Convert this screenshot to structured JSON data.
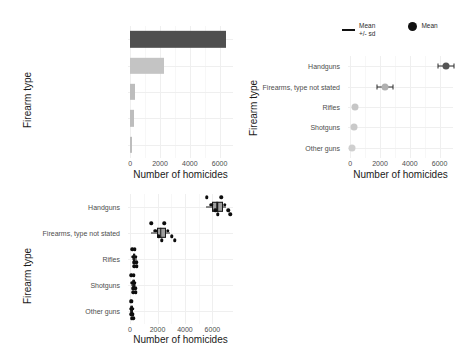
{
  "figure": {
    "categories": [
      "Other guns",
      "Shotguns",
      "Rifles",
      "Firearms, type not stated",
      "Handguns"
    ],
    "x_axis_title": "Number of homicides",
    "y_axis_title": "Firearm type",
    "x_ticks": [
      "0",
      "2000",
      "4000",
      "6000"
    ],
    "x_tick_values": [
      0,
      2000,
      4000,
      6000
    ],
    "x_range": [
      -150,
      6900
    ]
  },
  "chart_data": [
    {
      "id": "bar-panel",
      "type": "bar",
      "title": "",
      "xlabel": "Number of homicides",
      "ylabel": "Firearm type",
      "orientation": "horizontal",
      "categories": [
        "Other guns",
        "Shotguns",
        "Rifles",
        "Firearms, type not stated",
        "Handguns"
      ],
      "values": [
        100,
        250,
        300,
        2300,
        6400
      ],
      "bar_colors": [
        "#bdbdbd",
        "#bdbdbd",
        "#bdbdbd",
        "#c4c4c4",
        "#4f4f4f"
      ],
      "xlim": [
        -150,
        6900
      ],
      "xticks": [
        0,
        2000,
        4000,
        6000
      ],
      "grid": true,
      "legend": "none"
    },
    {
      "id": "mean-sd-panel",
      "type": "scatter",
      "title": "",
      "xlabel": "Number of homicides",
      "ylabel": "Firearm type",
      "categories": [
        "Other guns",
        "Shotguns",
        "Rifles",
        "Firearms, type not stated",
        "Handguns"
      ],
      "mean": [
        110,
        260,
        310,
        2320,
        6420
      ],
      "sd": [
        60,
        90,
        110,
        520,
        560
      ],
      "point_colors": [
        "#cfcfcf",
        "#c9c9c9",
        "#c6c6c6",
        "#b0b0b0",
        "#555555"
      ],
      "xlim": [
        -150,
        6900
      ],
      "xticks": [
        0,
        2000,
        4000,
        6000
      ],
      "grid": true,
      "legend_position": "top-right",
      "legend": [
        {
          "marker": "line",
          "label_line1": "Mean",
          "label_line2": "+/- sd"
        },
        {
          "marker": "dot",
          "label_line1": "Mean",
          "label_line2": ""
        }
      ]
    },
    {
      "id": "boxplot-panel",
      "type": "box",
      "title": "",
      "xlabel": "Number of homicides",
      "ylabel": "Firearm type",
      "categories": [
        "Other guns",
        "Shotguns",
        "Rifles",
        "Firearms, type not stated",
        "Handguns"
      ],
      "boxes": [
        {
          "category": "Other guns",
          "q1": 60,
          "median": 100,
          "q3": 160,
          "whisker_low": 20,
          "whisker_high": 230,
          "points": [
            40,
            70,
            95,
            110,
            130,
            155,
            185,
            215
          ]
        },
        {
          "category": "Shotguns",
          "q1": 180,
          "median": 250,
          "q3": 330,
          "whisker_low": 90,
          "whisker_high": 430,
          "points": [
            100,
            160,
            210,
            245,
            275,
            320,
            375,
            420
          ]
        },
        {
          "category": "Rifles",
          "q1": 230,
          "median": 300,
          "q3": 390,
          "whisker_low": 130,
          "whisker_high": 510,
          "points": [
            150,
            200,
            265,
            300,
            340,
            400,
            455,
            500
          ]
        },
        {
          "category": "Firearms, type not stated",
          "q1": 1950,
          "median": 2250,
          "q3": 2600,
          "whisker_low": 1500,
          "whisker_high": 2900,
          "points": [
            1550,
            1850,
            2100,
            2300,
            2500,
            2750,
            3050,
            3250
          ]
        },
        {
          "category": "Handguns",
          "q1": 5950,
          "median": 6350,
          "q3": 6800,
          "whisker_low": 5500,
          "whisker_high": 7000,
          "points": [
            5600,
            5900,
            6200,
            6400,
            6650,
            6900,
            7150,
            7300
          ]
        }
      ],
      "box_fill": "#9e9e9e",
      "point_color": "#0d0d0d",
      "xlim": [
        -150,
        7500
      ],
      "xticks": [
        0,
        2000,
        4000,
        6000
      ],
      "grid": true,
      "legend": "none"
    }
  ]
}
